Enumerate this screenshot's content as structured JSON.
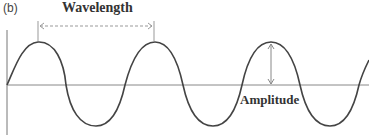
{
  "figure": {
    "panel_label": "(b)",
    "wavelength_label": "Wavelength",
    "amplitude_label": "Amplitude"
  },
  "colors": {
    "wave": "#444444",
    "axis": "#777777",
    "annotation": "#999999"
  }
}
